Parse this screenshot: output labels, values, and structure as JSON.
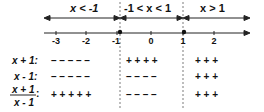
{
  "intervals": [
    {
      "label": "x < -1"
    },
    {
      "label": "-1 < x < 1"
    },
    {
      "label": "x > 1"
    }
  ],
  "number_line": {
    "ticks": [
      "-3",
      "-2",
      "-1",
      "0",
      "1",
      "2"
    ],
    "points": [
      "-1",
      "1"
    ]
  },
  "rows": [
    {
      "label": "x + 1:",
      "signs": [
        "– – – – –",
        "+ + + +",
        "+ + +"
      ]
    },
    {
      "label": "x - 1:",
      "signs": [
        "– – – – –",
        "– – – –",
        "+ + +"
      ]
    },
    {
      "label_num": "x + 1",
      "label_den": "x - 1",
      "signs": [
        "+ + + + +",
        "– – – –",
        "+ + +"
      ]
    }
  ]
}
